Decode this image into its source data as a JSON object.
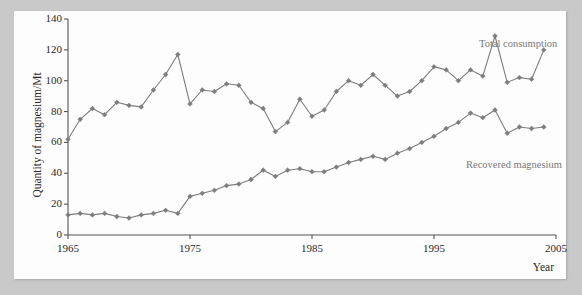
{
  "chart_data": {
    "type": "line",
    "title": "",
    "xlabel": "Year",
    "ylabel": "Quantity of magnesium/Mt",
    "xlim": [
      1964,
      2005
    ],
    "ylim": [
      0,
      140
    ],
    "xticks": [
      1965,
      1975,
      1985,
      1995,
      2005
    ],
    "yticks": [
      0,
      20,
      40,
      60,
      80,
      100,
      120,
      140
    ],
    "grid": false,
    "legend_position": "inline-annotation",
    "marker": "diamond",
    "series": [
      {
        "name": "Total consumption",
        "color": "#7d7d7d",
        "x": [
          1965,
          1966,
          1967,
          1968,
          1969,
          1970,
          1971,
          1972,
          1973,
          1974,
          1975,
          1976,
          1977,
          1978,
          1979,
          1980,
          1981,
          1982,
          1983,
          1984,
          1985,
          1986,
          1987,
          1988,
          1989,
          1990,
          1991,
          1992,
          1993,
          1994,
          1995,
          1996,
          1997,
          1998,
          1999,
          2000,
          2001,
          2002,
          2003,
          2004
        ],
        "values": [
          62,
          75,
          82,
          78,
          86,
          84,
          83,
          94,
          104,
          117,
          85,
          94,
          93,
          98,
          97,
          86,
          82,
          67,
          73,
          88,
          77,
          81,
          93,
          100,
          97,
          104,
          97,
          90,
          93,
          100,
          109,
          107,
          100,
          107,
          103,
          129,
          99,
          102,
          101,
          120
        ]
      },
      {
        "name": "Recovered magnesium",
        "color": "#7d7d7d",
        "x": [
          1965,
          1966,
          1967,
          1968,
          1969,
          1970,
          1971,
          1972,
          1973,
          1974,
          1975,
          1976,
          1977,
          1978,
          1979,
          1980,
          1981,
          1982,
          1983,
          1984,
          1985,
          1986,
          1987,
          1988,
          1989,
          1990,
          1991,
          1992,
          1993,
          1994,
          1995,
          1996,
          1997,
          1998,
          1999,
          2000,
          2001,
          2002,
          2003,
          2004
        ],
        "values": [
          13,
          14,
          13,
          14,
          12,
          11,
          13,
          14,
          16,
          14,
          25,
          27,
          29,
          32,
          33,
          36,
          42,
          38,
          42,
          43,
          41,
          41,
          44,
          47,
          49,
          51,
          49,
          53,
          56,
          60,
          64,
          69,
          73,
          79,
          76,
          81,
          66,
          70,
          69,
          70
        ]
      }
    ]
  },
  "annotations": {
    "total_consumption": "Total consumption",
    "recovered_magnesium": "Recovered magnesium"
  },
  "axes": {
    "y_title": "Quantity of magnesium/Mt",
    "x_title": "Year",
    "y_tick_labels": [
      "0",
      "20",
      "40",
      "60",
      "80",
      "100",
      "120",
      "140"
    ],
    "x_tick_labels": [
      "1965",
      "1975",
      "1985",
      "1995",
      "2005"
    ]
  },
  "colors": {
    "line": "#7d7d7d",
    "axis": "#555555",
    "text": "#2a2a2a",
    "annotation": "#7a7a7a",
    "page_background": "#c9c9c9",
    "plate": "#fdfdfd"
  }
}
